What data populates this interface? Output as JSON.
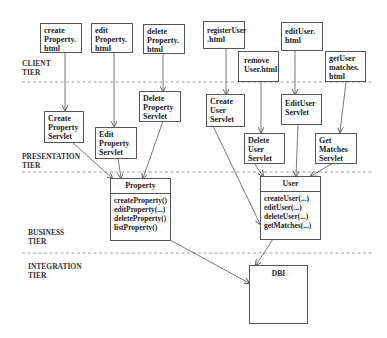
{
  "diagram": {
    "type": "multi-tier architecture diagram",
    "tiers": [
      {
        "id": "client",
        "line1": "CLIENT",
        "line2": "TIER"
      },
      {
        "id": "presentation",
        "line1": "PRESENTATION",
        "line2": "TIER"
      },
      {
        "id": "business",
        "line1": "BUSINESS",
        "line2": "TIER"
      },
      {
        "id": "integration",
        "line1": "INTEGRATION",
        "line2": "TIER"
      }
    ],
    "client_pages": [
      {
        "id": "create-property-html",
        "lines": [
          "create",
          "Property.",
          "html"
        ]
      },
      {
        "id": "edit-property-html",
        "lines": [
          "edit",
          "Property.",
          "html"
        ]
      },
      {
        "id": "delete-property-html",
        "lines": [
          "delete",
          "Property.",
          "html"
        ]
      },
      {
        "id": "register-user-html",
        "lines": [
          "registerUser",
          ".html"
        ]
      },
      {
        "id": "remove-user-html",
        "lines": [
          "remove",
          "User.html"
        ]
      },
      {
        "id": "edit-user-html",
        "lines": [
          "editUser.",
          "html"
        ]
      },
      {
        "id": "get-user-matches-html",
        "lines": [
          "getUser",
          "matches.",
          "html"
        ]
      }
    ],
    "servlets": [
      {
        "id": "create-property-servlet",
        "lines": [
          "Create",
          "Property",
          "Servlet"
        ]
      },
      {
        "id": "edit-property-servlet",
        "lines": [
          "Edit",
          "Property",
          "Servlet"
        ]
      },
      {
        "id": "delete-property-servlet",
        "lines": [
          "Delete",
          "Property",
          "Servlet"
        ]
      },
      {
        "id": "create-user-servlet",
        "lines": [
          "Create",
          "User",
          "Servlet"
        ]
      },
      {
        "id": "delete-user-servlet",
        "lines": [
          "Delete",
          "User",
          "Servlet"
        ]
      },
      {
        "id": "edituser-servlet",
        "lines": [
          "EditUser",
          "Servlet"
        ]
      },
      {
        "id": "get-matches-servlet",
        "lines": [
          "Get",
          "Matches",
          "Servlet"
        ]
      }
    ],
    "classes": [
      {
        "id": "property-class",
        "name": "Property",
        "operations": [
          "createProperty()",
          "editProperty(...)",
          "deleteProperty()",
          "listProperty()"
        ]
      },
      {
        "id": "user-class",
        "name": "User",
        "operations": [
          "createUser(...)",
          "editUser(...)",
          "deleteUser(...)",
          "getMatches(...)"
        ]
      }
    ],
    "integration": {
      "id": "dbi",
      "name": "DBI"
    },
    "connections": [
      [
        "create Property.html",
        "Create Property Servlet"
      ],
      [
        "edit Property.html",
        "Edit Property Servlet"
      ],
      [
        "delete Property.html",
        "Delete Property Servlet"
      ],
      [
        "registerUser.html",
        "Create User Servlet"
      ],
      [
        "remove User.html",
        "Delete User Servlet"
      ],
      [
        "editUser.html",
        "EditUser Servlet"
      ],
      [
        "getUser matches.html",
        "Get Matches Servlet"
      ],
      [
        "Create Property Servlet",
        "Property"
      ],
      [
        "Edit Property Servlet",
        "Property"
      ],
      [
        "Delete Property Servlet",
        "Property"
      ],
      [
        "Create User Servlet",
        "DBI"
      ],
      [
        "Delete User Servlet",
        "User"
      ],
      [
        "EditUser Servlet",
        "User"
      ],
      [
        "Get Matches Servlet",
        "User"
      ],
      [
        "Property",
        "DBI"
      ],
      [
        "User",
        "DBI"
      ]
    ],
    "colors": {
      "line": "#555555",
      "dash": "#777777",
      "text": "#222222",
      "background": "#ffffff"
    }
  }
}
